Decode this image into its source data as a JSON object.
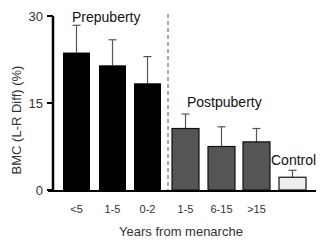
{
  "chart_data": {
    "type": "bar",
    "title": "",
    "xlabel": "Years from menarche",
    "ylabel": "BMC (L-R Diff) (%)",
    "ylim": [
      0,
      30
    ],
    "yticks": [
      0,
      15,
      30
    ],
    "grid": false,
    "legend": "none",
    "categories": [
      "<5",
      "1-5",
      "0-2",
      "1-5",
      "6-15",
      ">15",
      "Control"
    ],
    "tick_labels": [
      "<5",
      "1-5",
      "0-2",
      "1-5",
      "6-15",
      ">15",
      ""
    ],
    "groups": [
      {
        "name": "Prepuberty",
        "categories": [
          "<5",
          "1-5",
          "0-2"
        ],
        "color": "#000000"
      },
      {
        "name": "Postpuberty",
        "categories": [
          "1-5",
          "6-15",
          ">15"
        ],
        "color": "#555555"
      },
      {
        "name": "Control",
        "categories": [
          "Control"
        ],
        "color": "#eeeeee"
      }
    ],
    "values": [
      23.7,
      21.5,
      18.4,
      10.6,
      7.5,
      8.3,
      2.2
    ],
    "error_upper": [
      28.4,
      25.9,
      23.0,
      13.1,
      10.9,
      10.6,
      3.4
    ],
    "colors": [
      "#000000",
      "#000000",
      "#000000",
      "#555555",
      "#555555",
      "#555555",
      "#eeeeee"
    ],
    "annotations": [
      "Prepuberty",
      "Postpuberty",
      "Control"
    ],
    "divider": "dashed vertical line between prepuberty and postpuberty groups"
  }
}
